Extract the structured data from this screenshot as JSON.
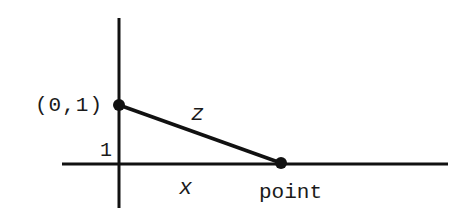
{
  "diagram": {
    "colors": {
      "stroke": "#111111",
      "background": "#ffffff"
    },
    "labels": {
      "start_point": "(0,1)",
      "segment": "z",
      "height": "1",
      "base": "x",
      "end_point": "point"
    },
    "points": [
      {
        "name": "start_point",
        "label": "(0,1)"
      },
      {
        "name": "end_point",
        "label": "point"
      }
    ]
  }
}
